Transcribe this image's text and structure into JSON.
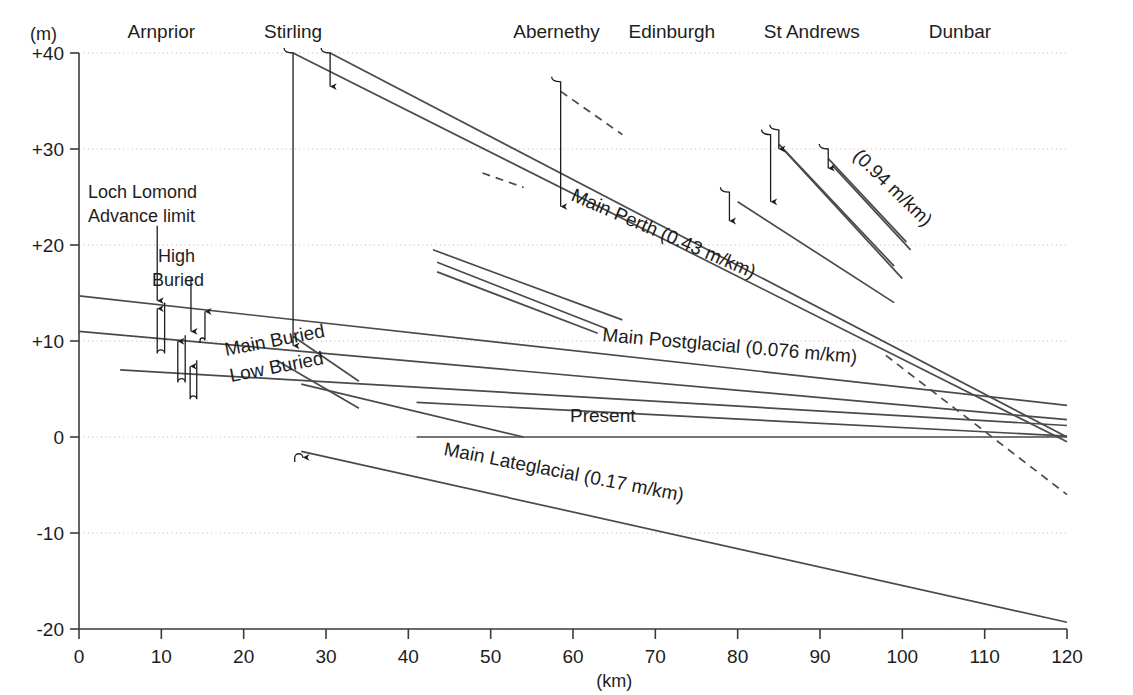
{
  "figure": {
    "y_unit_label": "(m)",
    "x_unit_label": "(km)"
  },
  "chart_data": {
    "type": "line",
    "title": "",
    "xlabel": "(km)",
    "ylabel": "(m)",
    "xlim": [
      0,
      120
    ],
    "ylim": [
      -20,
      40
    ],
    "grid": "dotted horizontal gridlines at each labelled y tick",
    "legend": "inline curve labels",
    "x_ticks": [
      "0",
      "10",
      "20",
      "30",
      "40",
      "50",
      "60",
      "70",
      "80",
      "90",
      "100",
      "110",
      "120"
    ],
    "y_ticks": [
      "+40",
      "+30",
      "+20",
      "+10",
      "0",
      "-10",
      "-20"
    ],
    "locality_labels": [
      {
        "name": "Arnprior",
        "km": 10
      },
      {
        "name": "Stirling",
        "km": 26
      },
      {
        "name": "Abernethy",
        "km": 58
      },
      {
        "name": "Edinburgh",
        "km": 72
      },
      {
        "name": "St Andrews",
        "km": 89
      },
      {
        "name": "Dunbar",
        "km": 107
      }
    ],
    "annotations": [
      {
        "text": "Loch Lomond Advance limit",
        "km": 9.5,
        "m": 24
      },
      {
        "text": "High Buried",
        "km": 13.5,
        "m": 18
      },
      {
        "text": "Main Buried",
        "km": 24,
        "m": 9
      },
      {
        "text": "Low Buried",
        "km": 24,
        "m": 7
      },
      {
        "text": "Present",
        "km": 56,
        "m": 1.5
      },
      {
        "text": "Main Perth (0.43 m/km)",
        "km": 70,
        "m": 24
      },
      {
        "text": "(0.94 m/km)",
        "km": 95,
        "m": 26
      },
      {
        "text": "Main Postglacial (0.076 m/km)",
        "km": 78,
        "m": 10
      },
      {
        "text": "Main Lateglacial (0.17 m/km)",
        "km": 62,
        "m": -6
      }
    ],
    "series": [
      {
        "name": "Main Perth",
        "gradient_m_per_km": 0.43,
        "label": "Main Perth (0.43 m/km)",
        "style": "solid",
        "points": [
          [
            26,
            40
          ],
          [
            120,
            -0.5
          ]
        ]
      },
      {
        "name": "Main Perth upper",
        "gradient_m_per_km": 0.43,
        "style": "solid",
        "points": [
          [
            30.5,
            40
          ],
          [
            120,
            0.0
          ]
        ]
      },
      {
        "name": "Main Perth dashed extension",
        "style": "dashed",
        "points": [
          [
            98,
            8.5
          ],
          [
            120,
            -6.0
          ]
        ]
      },
      {
        "name": "Abernethy dashed",
        "style": "dashed",
        "points": [
          [
            58.5,
            36
          ],
          [
            66,
            31.5
          ]
        ]
      },
      {
        "name": "Main Perth short dashed segment",
        "style": "dashed",
        "points": [
          [
            49,
            27.5
          ],
          [
            54,
            26
          ]
        ]
      },
      {
        "name": "Main Postglacial",
        "gradient_m_per_km": 0.076,
        "label": "Main Postglacial (0.076 m/km)",
        "style": "solid",
        "points": [
          [
            0,
            14.7
          ],
          [
            120,
            3.3
          ]
        ]
      },
      {
        "name": "Postglacial lower",
        "gradient_m_per_km": 0.076,
        "style": "solid",
        "points": [
          [
            0,
            11.0
          ],
          [
            120,
            1.8
          ]
        ]
      },
      {
        "name": "Postglacial lowest",
        "gradient_m_per_km": 0.076,
        "style": "solid",
        "points": [
          [
            5,
            7.0
          ],
          [
            120,
            1.2
          ]
        ]
      },
      {
        "name": "Main Buried",
        "label": "Main Buried",
        "style": "solid",
        "points": [
          [
            26,
            10.5
          ],
          [
            34,
            5.8
          ]
        ]
      },
      {
        "name": "Low Buried",
        "label": "Low Buried",
        "style": "solid",
        "points": [
          [
            24,
            8.0
          ],
          [
            34,
            3.0
          ]
        ]
      },
      {
        "name": "Present",
        "label": "Present",
        "style": "solid",
        "points": [
          [
            41,
            0
          ],
          [
            120,
            0
          ]
        ]
      },
      {
        "name": "Main Lateglacial",
        "gradient_m_per_km": 0.17,
        "label": "Main Lateglacial (0.17 m/km)",
        "style": "solid",
        "points": [
          [
            27,
            -1.5
          ],
          [
            120,
            -19.3
          ]
        ]
      },
      {
        "name": "St Andrews fan a",
        "gradient_m_per_km": 0.94,
        "style": "solid",
        "points": [
          [
            85,
            30.5
          ],
          [
            99,
            17.8
          ]
        ]
      },
      {
        "name": "St Andrews fan b",
        "gradient_m_per_km": 0.94,
        "style": "solid",
        "points": [
          [
            85.5,
            30.0
          ],
          [
            100,
            16.5
          ]
        ]
      },
      {
        "name": "St Andrews fan c",
        "gradient_m_per_km": 0.94,
        "label": "(0.94 m/km)",
        "style": "solid",
        "points": [
          [
            91,
            29.0
          ],
          [
            100.5,
            20.3
          ]
        ]
      },
      {
        "name": "St Andrews fan d",
        "gradient_m_per_km": 0.94,
        "style": "solid",
        "points": [
          [
            91.5,
            28.3
          ],
          [
            101,
            19.5
          ]
        ]
      },
      {
        "name": "St Andrews fan e",
        "style": "solid",
        "points": [
          [
            80,
            24.5
          ],
          [
            99,
            14.0
          ]
        ]
      },
      {
        "name": "Mid fan 1",
        "style": "solid",
        "points": [
          [
            43,
            19.5
          ],
          [
            66,
            12.2
          ]
        ]
      },
      {
        "name": "Mid fan 2",
        "style": "solid",
        "points": [
          [
            43.5,
            18.2
          ],
          [
            64,
            11.3
          ]
        ]
      },
      {
        "name": "Mid fan 3",
        "style": "solid",
        "points": [
          [
            43.5,
            17.2
          ],
          [
            63,
            10.8
          ]
        ]
      },
      {
        "name": "Lower converging 1",
        "style": "solid",
        "points": [
          [
            41,
            3.6
          ],
          [
            120,
            0.1
          ]
        ]
      },
      {
        "name": "Lower converging 2",
        "style": "solid",
        "points": [
          [
            27,
            5.5
          ],
          [
            54,
            0
          ]
        ]
      }
    ],
    "down_arrows": [
      {
        "km": 26,
        "from_m": 40,
        "to_m": 9.5,
        "hook": "left"
      },
      {
        "km": 30.5,
        "from_m": 40,
        "to_m": 36.5,
        "hook": "left"
      },
      {
        "km": 58.5,
        "from_m": 37,
        "to_m": 24,
        "hook": "left"
      },
      {
        "km": 79,
        "from_m": 25.5,
        "to_m": 22.5,
        "hook": "left"
      },
      {
        "km": 84,
        "from_m": 31.5,
        "to_m": 24.5,
        "hook": "left"
      },
      {
        "km": 85,
        "from_m": 32,
        "to_m": 30,
        "hook": "left"
      },
      {
        "km": 91,
        "from_m": 30,
        "to_m": 28,
        "hook": "left"
      },
      {
        "km": 9.5,
        "from_m": 22,
        "to_m": 14.2,
        "hook": "none"
      },
      {
        "km": 13.6,
        "from_m": 16.5,
        "to_m": 11.0,
        "hook": "none"
      }
    ],
    "hook_arrows": [
      {
        "km_down": 9.5,
        "km_up": 10.4,
        "top_m": 14.0,
        "bottom_m": 8.3,
        "dir": "down"
      },
      {
        "km_down": 12.0,
        "km_up": 12.9,
        "top_m": 10.6,
        "bottom_m": 5.3,
        "dir": "down"
      },
      {
        "km_down": 13.5,
        "km_up": 14.3,
        "top_m": 8.0,
        "bottom_m": 3.6,
        "dir": "down"
      },
      {
        "km_down": 14.7,
        "km_up": 15.3,
        "top_m": 13.7,
        "bottom_m": 9.8,
        "dir": "up"
      },
      {
        "km_down": 26.2,
        "km_up": 27.2,
        "top_m": -1.5,
        "bottom_m": -2.6,
        "dir": "up"
      }
    ]
  }
}
